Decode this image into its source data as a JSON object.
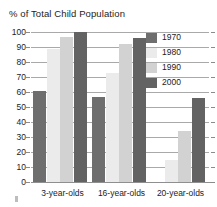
{
  "chart_data": {
    "type": "bar",
    "title": "% of Total Child Population",
    "xlabel": "",
    "ylabel": "",
    "ylim": [
      0,
      100
    ],
    "yticks": [
      100,
      90,
      80,
      70,
      60,
      50,
      40,
      30,
      20,
      10,
      0
    ],
    "grid": true,
    "legend_position": "top-right",
    "categories": [
      "3-year-olds",
      "16-year-olds",
      "20-year-olds"
    ],
    "series": [
      {
        "name": "1970",
        "color": "#6e6e6e",
        "values": [
          61,
          57,
          0
        ]
      },
      {
        "name": "1980",
        "color": "#ebebeb",
        "values": [
          89,
          73,
          15
        ]
      },
      {
        "name": "1990",
        "color": "#d2d2d2",
        "values": [
          97,
          92,
          34
        ]
      },
      {
        "name": "2000",
        "color": "#636363",
        "values": [
          100,
          96,
          56
        ]
      }
    ]
  },
  "axis": {
    "ytick_labels": [
      "100",
      "90",
      "80",
      "70",
      "60",
      "50",
      "40",
      "30",
      "20",
      "10",
      "0"
    ],
    "xtick_labels": [
      "3-year-olds",
      "16-year-olds",
      "20-year-olds"
    ]
  },
  "legend": {
    "items": [
      {
        "label": "1970"
      },
      {
        "label": "1980"
      },
      {
        "label": "1990"
      },
      {
        "label": "2000"
      }
    ]
  },
  "colors": {
    "gridline": "#a9a9a9",
    "text": "#1c1c1c",
    "background": "#ffffff"
  }
}
